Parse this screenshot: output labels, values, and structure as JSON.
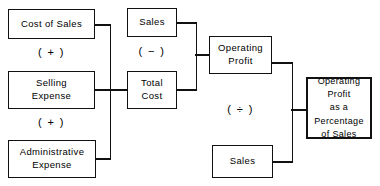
{
  "diagram": {
    "colors": {
      "background": "#ffffff",
      "stroke": "#111111",
      "text": "#000000"
    },
    "nodes": {
      "cost_of_sales": "Cost of Sales",
      "selling_expense": "Selling\nExpense",
      "administrative_expense": "Administrative\nExpense",
      "sales_top": "Sales",
      "total_cost": "Total\nCost",
      "operating_profit": "Operating\nProfit",
      "sales_bottom": "Sales",
      "result": "Operating\nProfit\nas a\nPercentage\nof Sales"
    },
    "operators": {
      "plus_upper": "( + )",
      "plus_lower": "( + )",
      "minus": "( − )",
      "divide": "( ÷ )"
    }
  }
}
